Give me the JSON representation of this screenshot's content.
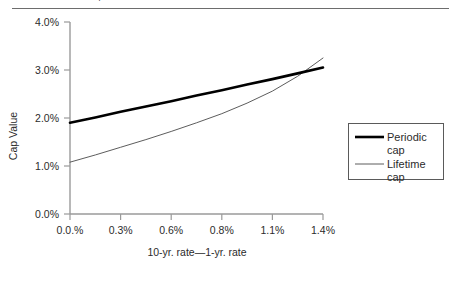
{
  "figure": {
    "clipped_header_fragment": "¡",
    "rule_color": "#6d6d6d"
  },
  "axis": {
    "y_title": "Cap Value",
    "x_title": "10-yr. rate—1-yr. rate",
    "y_ticks": [
      "0.0%",
      "1.0%",
      "2.0%",
      "3.0%",
      "4.0%"
    ],
    "x_ticks": [
      "0.0.%",
      "0.3%",
      "0.6%",
      "0.8%",
      "1.1%",
      "1.4%"
    ]
  },
  "legend": {
    "items": [
      {
        "label_line1": "Periodic",
        "label_line2": "cap",
        "color": "#000000",
        "width": 2.6
      },
      {
        "label_line1": "Lifetime",
        "label_line2": "cap",
        "color": "#4a4a4a",
        "width": 0.9
      }
    ]
  },
  "chart_data": {
    "type": "line",
    "title": "",
    "xlabel": "10-yr. rate—1-yr. rate",
    "ylabel": "Cap Value",
    "xlim": [
      0.0,
      1.4
    ],
    "ylim": [
      0.0,
      4.0
    ],
    "x_tick_values": [
      0.0,
      0.28,
      0.56,
      0.84,
      1.12,
      1.4
    ],
    "x_tick_labels": [
      "0.0.%",
      "0.3%",
      "0.6%",
      "0.8%",
      "1.1%",
      "1.4%"
    ],
    "y_tick_values": [
      0.0,
      1.0,
      2.0,
      3.0,
      4.0
    ],
    "y_tick_labels": [
      "0.0%",
      "1.0%",
      "2.0%",
      "3.0%",
      "4.0%"
    ],
    "grid": false,
    "legend_position": "right",
    "x": [
      0.0,
      0.14,
      0.28,
      0.42,
      0.56,
      0.7,
      0.84,
      0.98,
      1.12,
      1.26,
      1.4
    ],
    "series": [
      {
        "name": "Periodic cap",
        "values": [
          1.9,
          2.01,
          2.13,
          2.24,
          2.35,
          2.47,
          2.58,
          2.7,
          2.81,
          2.93,
          3.05
        ],
        "color": "#000000",
        "line_width": 2.6
      },
      {
        "name": "Lifetime cap",
        "values": [
          1.08,
          1.23,
          1.39,
          1.55,
          1.72,
          1.9,
          2.09,
          2.31,
          2.56,
          2.87,
          3.25
        ],
        "color": "#4a4a4a",
        "line_width": 0.9
      }
    ],
    "annotations": [
      {
        "text": "curves cross near x=1.25%, y=2.93%"
      }
    ]
  }
}
